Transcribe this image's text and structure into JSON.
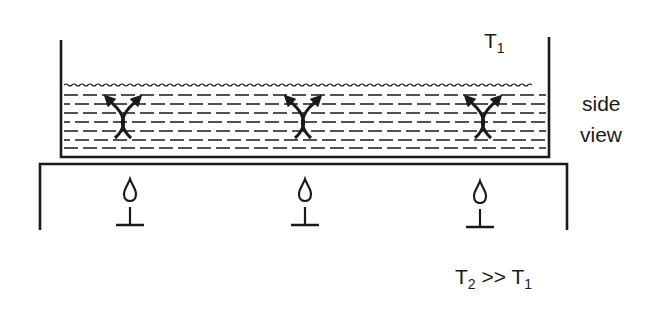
{
  "diagram": {
    "labels": {
      "top_temp": "T",
      "top_temp_sub": "1",
      "view_line1": "side",
      "view_line2": "view",
      "bottom_temp_a": "T",
      "bottom_temp_a_sub": "2",
      "bottom_relation": " >> ",
      "bottom_temp_b": "T",
      "bottom_temp_b_sub": "1"
    },
    "components": {
      "container": "open water tank",
      "water": "liquid with wavy surface",
      "convection_cells": [
        "left",
        "center",
        "right"
      ],
      "burners": [
        "left",
        "center",
        "right"
      ],
      "table": "heating table"
    },
    "colors": {
      "ink": "#1a1a1a",
      "background": "#ffffff"
    }
  }
}
